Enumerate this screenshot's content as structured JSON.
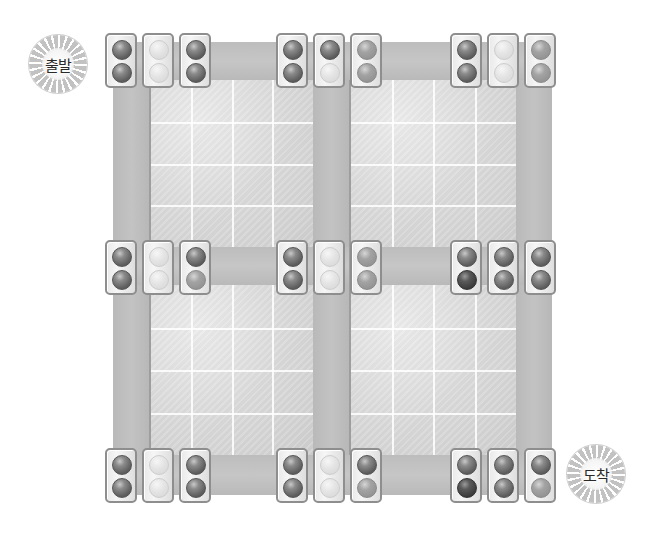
{
  "diagram": {
    "type": "traffic-light-road-map",
    "start_label": "출발",
    "end_label": "도착",
    "lamp_states_legend": {
      "on-dark": "lit (dark gray)",
      "on-darker": "lit (darkest)",
      "mid": "medium gray",
      "off": "unlit (light)"
    },
    "signal_groups": [
      {
        "row": "top",
        "col": "left",
        "signals": [
          [
            "on-dark",
            "on-dark"
          ],
          [
            "off",
            "off"
          ],
          [
            "on-dark",
            "on-dark"
          ]
        ]
      },
      {
        "row": "top",
        "col": "middle",
        "signals": [
          [
            "on-dark",
            "on-dark"
          ],
          [
            "on-dark",
            "off"
          ],
          [
            "mid",
            "mid"
          ]
        ]
      },
      {
        "row": "top",
        "col": "right",
        "signals": [
          [
            "on-dark",
            "on-dark"
          ],
          [
            "off",
            "off"
          ],
          [
            "mid",
            "mid"
          ]
        ]
      },
      {
        "row": "middle",
        "col": "left",
        "signals": [
          [
            "on-dark",
            "on-dark"
          ],
          [
            "off",
            "off"
          ],
          [
            "on-dark",
            "mid"
          ]
        ]
      },
      {
        "row": "middle",
        "col": "middle",
        "signals": [
          [
            "on-dark",
            "on-dark"
          ],
          [
            "off",
            "off"
          ],
          [
            "mid",
            "mid"
          ]
        ]
      },
      {
        "row": "middle",
        "col": "right",
        "signals": [
          [
            "on-dark",
            "on-darker"
          ],
          [
            "on-dark",
            "on-dark"
          ],
          [
            "on-dark",
            "on-dark"
          ]
        ]
      },
      {
        "row": "bottom",
        "col": "left",
        "signals": [
          [
            "on-dark",
            "on-dark"
          ],
          [
            "off",
            "off"
          ],
          [
            "on-dark",
            "on-dark"
          ]
        ]
      },
      {
        "row": "bottom",
        "col": "middle",
        "signals": [
          [
            "on-dark",
            "on-dark"
          ],
          [
            "off",
            "off"
          ],
          [
            "on-dark",
            "mid"
          ]
        ]
      },
      {
        "row": "bottom",
        "col": "right",
        "signals": [
          [
            "on-dark",
            "on-darker"
          ],
          [
            "on-dark",
            "on-dark"
          ],
          [
            "on-dark",
            "mid"
          ]
        ]
      }
    ]
  }
}
